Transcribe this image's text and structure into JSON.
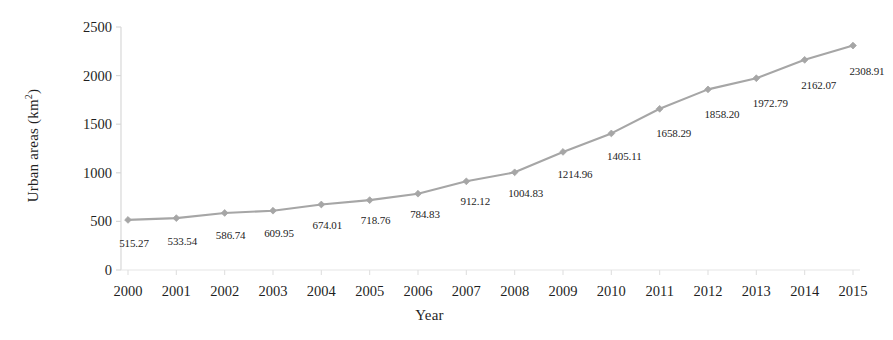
{
  "chart_data": {
    "type": "line",
    "title": "",
    "xlabel": "Year",
    "ylabel": "Urban areas (km2)",
    "ylabel_display": "Urban areas (km",
    "ylabel_sup": "2",
    "ylabel_tail": ")",
    "categories": [
      "2000",
      "2001",
      "2002",
      "2003",
      "2004",
      "2005",
      "2006",
      "2007",
      "2008",
      "2009",
      "2010",
      "2011",
      "2012",
      "2013",
      "2014",
      "2015"
    ],
    "values": [
      515.27,
      533.54,
      586.74,
      609.95,
      674.01,
      718.76,
      784.83,
      912.12,
      1004.83,
      1214.96,
      1405.11,
      1658.29,
      1858.2,
      1972.79,
      2162.07,
      2308.91
    ],
    "point_labels": [
      "515.27",
      "533.54",
      "586.74",
      "609.95",
      "674.01",
      "718.76",
      "784.83",
      "912.12",
      "1004.83",
      "1214.96",
      "1405.11",
      "1658.29",
      "1858.20",
      "1972.79",
      "2162.07",
      "2308.91"
    ],
    "ytick_values": [
      0,
      500,
      1000,
      1500,
      2000,
      2500
    ],
    "ytick_labels": [
      "0",
      "500",
      "1000",
      "1500",
      "2000",
      "2500"
    ],
    "ylim": [
      0,
      2500
    ],
    "grid": false,
    "legend": null,
    "legend_position": "none",
    "series_color": "#a6a6a6",
    "marker": "diamond",
    "marker_color": "#a6a6a6",
    "axis_color": "#d8d8d8",
    "text_color": "#1f1f1f",
    "background": "#ffffff"
  }
}
